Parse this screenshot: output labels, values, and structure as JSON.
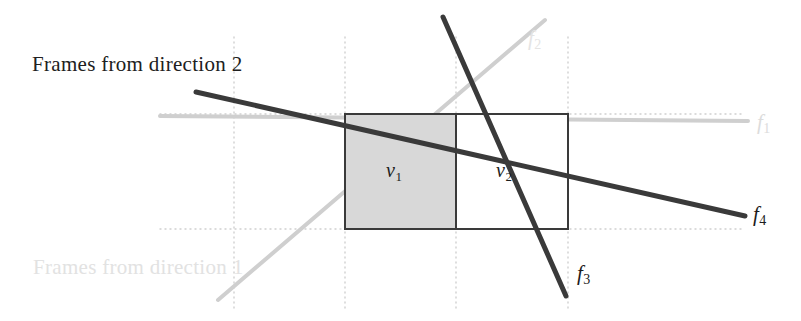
{
  "figure": {
    "width": 801,
    "height": 321,
    "background": "#ffffff"
  },
  "captions": {
    "direction2": "Frames from direction 2",
    "direction1": "Frames from direction 1"
  },
  "cells": [
    {
      "name": "v",
      "subscript": "1",
      "fill": "#d8d8d8",
      "x": 345,
      "y": 114,
      "w": 111,
      "h": 115
    },
    {
      "name": "v",
      "subscript": "2",
      "fill": "#ffffff",
      "x": 456,
      "y": 114,
      "w": 112,
      "h": 115
    }
  ],
  "rectangle": {
    "x": 345,
    "y": 114,
    "width": 223,
    "height": 115,
    "stroke": "#3a3a3a",
    "divider_x": 456
  },
  "lines": [
    {
      "id": "f1",
      "label": "f",
      "subscript": "1",
      "color": "#cfcfcf",
      "x1": 160,
      "y1": 116,
      "x2": 748,
      "y2": 121,
      "width": 4,
      "note": "light-gray ray, direction 1, upper"
    },
    {
      "id": "f2",
      "label": "f",
      "subscript": "2",
      "color": "#cfcfcf",
      "x1": 218,
      "y1": 300,
      "x2": 545,
      "y2": 20,
      "width": 4,
      "note": "light-gray ray, direction 1, lower"
    },
    {
      "id": "f3",
      "label": "f",
      "subscript": "3",
      "color": "#3a3a3a",
      "x1": 443,
      "y1": 17,
      "x2": 566,
      "y2": 296,
      "width": 5,
      "note": "dark ray, direction 2, left"
    },
    {
      "id": "f4",
      "label": "f",
      "subscript": "4",
      "color": "#3a3a3a",
      "x1": 196,
      "y1": 92,
      "x2": 745,
      "y2": 216,
      "width": 5,
      "note": "dark ray, direction 2, right"
    }
  ],
  "grid": {
    "color": "#d0d0d0",
    "dash": "1,4",
    "vertical_x": [
      234,
      345,
      456,
      568
    ],
    "vertical_y_range": [
      37,
      312
    ],
    "horizontal_y": [
      114,
      229
    ],
    "horizontal_x_range": [
      160,
      742
    ]
  },
  "labels": {
    "f1": {
      "base": "f",
      "sub": "1"
    },
    "f2": {
      "base": "f",
      "sub": "2"
    },
    "f3": {
      "base": "f",
      "sub": "3"
    },
    "f4": {
      "base": "f",
      "sub": "4"
    },
    "v1": {
      "base": "v",
      "sub": "1"
    },
    "v2": {
      "base": "v",
      "sub": "2"
    }
  }
}
